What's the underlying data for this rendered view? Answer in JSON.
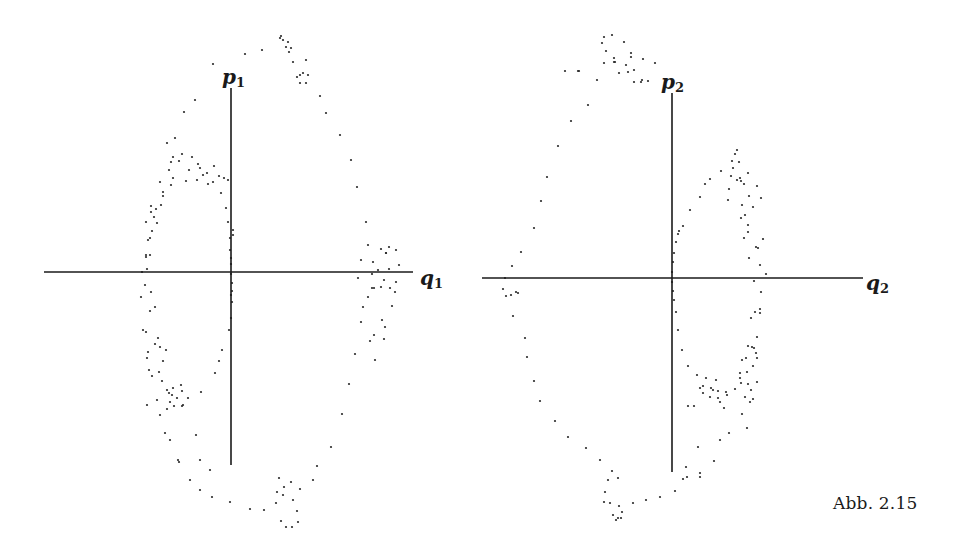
{
  "figure": {
    "caption": "Abb. 2.15",
    "ink_color": "#1a1a1a",
    "background": "#ffffff"
  },
  "chart_data": [
    {
      "type": "scatter",
      "title": "",
      "xlabel": "q1",
      "ylabel": "p1",
      "x_label_main": "q",
      "x_label_sub": "1",
      "y_label_main": "p",
      "y_label_sub": "1",
      "grid": false,
      "legend": null,
      "axes_px": {
        "origin": [
          231,
          272
        ],
        "x_from": 44,
        "x_to": 413,
        "y_from": 88,
        "y_to": 465
      },
      "points_px": [
        [
          280,
          38
        ],
        [
          281,
          36
        ],
        [
          283,
          40
        ],
        [
          288,
          42
        ],
        [
          291,
          48
        ],
        [
          286,
          47
        ],
        [
          289,
          52
        ],
        [
          293,
          62
        ],
        [
          300,
          75
        ],
        [
          306,
          83
        ],
        [
          303,
          73
        ],
        [
          308,
          75
        ],
        [
          297,
          77
        ],
        [
          300,
          83
        ],
        [
          306,
          60
        ],
        [
          262,
          50
        ],
        [
          245,
          54
        ],
        [
          213,
          64
        ],
        [
          195,
          100
        ],
        [
          184,
          112
        ],
        [
          175,
          138
        ],
        [
          169,
          170
        ],
        [
          161,
          205
        ],
        [
          152,
          231
        ],
        [
          146,
          255
        ],
        [
          142,
          272
        ],
        [
          141,
          297
        ],
        [
          143,
          330
        ],
        [
          149,
          370
        ],
        [
          157,
          400
        ],
        [
          165,
          433
        ],
        [
          178,
          460
        ],
        [
          190,
          480
        ],
        [
          200,
          490
        ],
        [
          212,
          497
        ],
        [
          230,
          502
        ],
        [
          250,
          509
        ],
        [
          264,
          510
        ],
        [
          281,
          521
        ],
        [
          286,
          527
        ],
        [
          292,
          527
        ],
        [
          297,
          511
        ],
        [
          298,
          522
        ],
        [
          293,
          500
        ],
        [
          291,
          482
        ],
        [
          279,
          478
        ],
        [
          284,
          487
        ],
        [
          277,
          492
        ],
        [
          276,
          503
        ],
        [
          283,
          495
        ],
        [
          300,
          489
        ],
        [
          313,
          480
        ],
        [
          317,
          466
        ],
        [
          331,
          447
        ],
        [
          342,
          414
        ],
        [
          349,
          384
        ],
        [
          355,
          354
        ],
        [
          361,
          322
        ],
        [
          363,
          307
        ],
        [
          368,
          297
        ],
        [
          374,
          288
        ],
        [
          384,
          280
        ],
        [
          378,
          270
        ],
        [
          373,
          262
        ],
        [
          381,
          249
        ],
        [
          389,
          247
        ],
        [
          396,
          250
        ],
        [
          399,
          265
        ],
        [
          396,
          282
        ],
        [
          395,
          292
        ],
        [
          392,
          306
        ],
        [
          385,
          327
        ],
        [
          374,
          335
        ],
        [
          370,
          341
        ],
        [
          382,
          320
        ],
        [
          384,
          339
        ],
        [
          375,
          360
        ],
        [
          358,
          278
        ],
        [
          361,
          260
        ],
        [
          386,
          253
        ],
        [
          381,
          287
        ],
        [
          372,
          274
        ],
        [
          390,
          288
        ],
        [
          368,
          245
        ],
        [
          372,
          288
        ],
        [
          386,
          253
        ],
        [
          389,
          269
        ],
        [
          366,
          222
        ],
        [
          357,
          187
        ],
        [
          351,
          160
        ],
        [
          340,
          135
        ],
        [
          326,
          113
        ],
        [
          320,
          96
        ],
        [
          167,
          143
        ],
        [
          173,
          157
        ],
        [
          171,
          162
        ],
        [
          179,
          161
        ],
        [
          182,
          154
        ],
        [
          192,
          157
        ],
        [
          198,
          164
        ],
        [
          200,
          168
        ],
        [
          207,
          173
        ],
        [
          214,
          166
        ],
        [
          203,
          175
        ],
        [
          197,
          180
        ],
        [
          213,
          182
        ],
        [
          224,
          178
        ],
        [
          219,
          176
        ],
        [
          228,
          180
        ],
        [
          208,
          184
        ],
        [
          189,
          170
        ],
        [
          186,
          181
        ],
        [
          171,
          185
        ],
        [
          173,
          178
        ],
        [
          160,
          182
        ],
        [
          163,
          192
        ],
        [
          163,
          196
        ],
        [
          156,
          209
        ],
        [
          151,
          206
        ],
        [
          151,
          212
        ],
        [
          146,
          222
        ],
        [
          154,
          217
        ],
        [
          157,
          223
        ],
        [
          150,
          238
        ],
        [
          148,
          240
        ],
        [
          146,
          257
        ],
        [
          150,
          255
        ],
        [
          147,
          269
        ],
        [
          145,
          285
        ],
        [
          151,
          292
        ],
        [
          155,
          307
        ],
        [
          150,
          311
        ],
        [
          146,
          332
        ],
        [
          155,
          344
        ],
        [
          158,
          338
        ],
        [
          148,
          352
        ],
        [
          147,
          358
        ],
        [
          152,
          376
        ],
        [
          160,
          347
        ],
        [
          166,
          350
        ],
        [
          163,
          361
        ],
        [
          159,
          372
        ],
        [
          162,
          381
        ],
        [
          167,
          390
        ],
        [
          169,
          393
        ],
        [
          173,
          388
        ],
        [
          172,
          395
        ],
        [
          170,
          402
        ],
        [
          177,
          398
        ],
        [
          181,
          385
        ],
        [
          182,
          391
        ],
        [
          167,
          409
        ],
        [
          183,
          405
        ],
        [
          174,
          406
        ],
        [
          182,
          406
        ],
        [
          188,
          398
        ],
        [
          201,
          392
        ],
        [
          215,
          373
        ],
        [
          219,
          361
        ],
        [
          222,
          350
        ],
        [
          229,
          330
        ],
        [
          231,
          318
        ],
        [
          232,
          302
        ],
        [
          231,
          295
        ],
        [
          232,
          291
        ],
        [
          232,
          283
        ],
        [
          231,
          274
        ],
        [
          231,
          264
        ],
        [
          231,
          258
        ],
        [
          230,
          250
        ],
        [
          230,
          238
        ],
        [
          228,
          222
        ],
        [
          226,
          208
        ],
        [
          221,
          193
        ],
        [
          179,
          462
        ],
        [
          200,
          460
        ],
        [
          210,
          470
        ],
        [
          170,
          440
        ],
        [
          160,
          415
        ],
        [
          147,
          405
        ],
        [
          196,
          435
        ],
        [
          233,
          230
        ],
        [
          233,
          235
        ]
      ]
    },
    {
      "type": "scatter",
      "title": "",
      "xlabel": "q2",
      "ylabel": "p2",
      "x_label_main": "q",
      "x_label_sub": "2",
      "y_label_main": "p",
      "y_label_sub": "2",
      "grid": false,
      "legend": null,
      "axes_px": {
        "origin": [
          672,
          278
        ],
        "x_from": 482,
        "x_to": 863,
        "y_from": 93,
        "y_to": 472
      },
      "points_px": [
        [
          604,
          37
        ],
        [
          612,
          35
        ],
        [
          602,
          43
        ],
        [
          624,
          42
        ],
        [
          606,
          51
        ],
        [
          614,
          58
        ],
        [
          631,
          53
        ],
        [
          615,
          62
        ],
        [
          604,
          63
        ],
        [
          614,
          62
        ],
        [
          628,
          72
        ],
        [
          631,
          57
        ],
        [
          626,
          65
        ],
        [
          643,
          59
        ],
        [
          634,
          70
        ],
        [
          642,
          80
        ],
        [
          579,
          71
        ],
        [
          619,
          73
        ],
        [
          655,
          63
        ],
        [
          634,
          82
        ],
        [
          641,
          82
        ],
        [
          648,
          81
        ],
        [
          565,
          71
        ],
        [
          578,
          71
        ],
        [
          597,
          80
        ],
        [
          588,
          105
        ],
        [
          571,
          121
        ],
        [
          558,
          146
        ],
        [
          547,
          177
        ],
        [
          541,
          201
        ],
        [
          534,
          228
        ],
        [
          521,
          252
        ],
        [
          512,
          266
        ],
        [
          505,
          278
        ],
        [
          503,
          289
        ],
        [
          511,
          295
        ],
        [
          518,
          293
        ],
        [
          506,
          296
        ],
        [
          516,
          292
        ],
        [
          513,
          316
        ],
        [
          525,
          338
        ],
        [
          527,
          357
        ],
        [
          534,
          381
        ],
        [
          540,
          401
        ],
        [
          555,
          421
        ],
        [
          568,
          437
        ],
        [
          586,
          448
        ],
        [
          600,
          460
        ],
        [
          612,
          471
        ],
        [
          608,
          480
        ],
        [
          618,
          478
        ],
        [
          605,
          492
        ],
        [
          604,
          502
        ],
        [
          610,
          503
        ],
        [
          619,
          506
        ],
        [
          618,
          518
        ],
        [
          616,
          520
        ],
        [
          621,
          518
        ],
        [
          613,
          515
        ],
        [
          622,
          512
        ],
        [
          633,
          503
        ],
        [
          646,
          500
        ],
        [
          660,
          497
        ],
        [
          675,
          491
        ],
        [
          687,
          477
        ],
        [
          686,
          467
        ],
        [
          700,
          477
        ],
        [
          714,
          461
        ],
        [
          698,
          447
        ],
        [
          720,
          440
        ],
        [
          729,
          433
        ],
        [
          742,
          414
        ],
        [
          748,
          384
        ],
        [
          754,
          348
        ],
        [
          760,
          313
        ],
        [
          766,
          274
        ],
        [
          763,
          239
        ],
        [
          753,
          207
        ],
        [
          737,
          180
        ],
        [
          721,
          171
        ],
        [
          710,
          179
        ],
        [
          705,
          184
        ],
        [
          700,
          197
        ],
        [
          690,
          210
        ],
        [
          683,
          226
        ],
        [
          679,
          231
        ],
        [
          678,
          234
        ],
        [
          676,
          242
        ],
        [
          674,
          253
        ],
        [
          673,
          262
        ],
        [
          672,
          272
        ],
        [
          672,
          282
        ],
        [
          673,
          291
        ],
        [
          674,
          300
        ],
        [
          676,
          312
        ],
        [
          678,
          330
        ],
        [
          682,
          350
        ],
        [
          688,
          366
        ],
        [
          697,
          375
        ],
        [
          703,
          386
        ],
        [
          711,
          388
        ],
        [
          718,
          391
        ],
        [
          726,
          392
        ],
        [
          735,
          389
        ],
        [
          740,
          373
        ],
        [
          746,
          358
        ],
        [
          748,
          346
        ],
        [
          752,
          347
        ],
        [
          756,
          353
        ],
        [
          757,
          358
        ],
        [
          753,
          366
        ],
        [
          747,
          372
        ],
        [
          740,
          378
        ],
        [
          741,
          383
        ],
        [
          745,
          397
        ],
        [
          753,
          399
        ],
        [
          750,
          402
        ],
        [
          757,
          382
        ],
        [
          751,
          390
        ],
        [
          742,
          360
        ],
        [
          757,
          337
        ],
        [
          751,
          318
        ],
        [
          755,
          312
        ],
        [
          760,
          265
        ],
        [
          758,
          248
        ],
        [
          756,
          247
        ],
        [
          748,
          232
        ],
        [
          748,
          225
        ],
        [
          745,
          215
        ],
        [
          742,
          205
        ],
        [
          749,
          196
        ],
        [
          761,
          198
        ],
        [
          757,
          186
        ],
        [
          744,
          184
        ],
        [
          731,
          176
        ],
        [
          740,
          178
        ],
        [
          733,
          168
        ],
        [
          732,
          161
        ],
        [
          735,
          154
        ],
        [
          737,
          150
        ],
        [
          739,
          162
        ],
        [
          741,
          181
        ],
        [
          729,
          189
        ],
        [
          728,
          200
        ],
        [
          748,
          173
        ],
        [
          741,
          218
        ],
        [
          744,
          238
        ],
        [
          749,
          258
        ],
        [
          754,
          281
        ],
        [
          761,
          292
        ],
        [
          760,
          309
        ],
        [
          720,
          402
        ],
        [
          727,
          395
        ],
        [
          716,
          380
        ],
        [
          703,
          393
        ],
        [
          710,
          397
        ],
        [
          718,
          398
        ],
        [
          724,
          408
        ],
        [
          688,
          406
        ],
        [
          694,
          406
        ],
        [
          700,
          388
        ],
        [
          706,
          378
        ],
        [
          713,
          390
        ],
        [
          683,
          479
        ],
        [
          700,
          473
        ],
        [
          747,
          428
        ]
      ]
    }
  ]
}
